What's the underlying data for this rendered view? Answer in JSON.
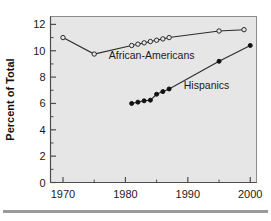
{
  "chart_data": {
    "type": "line",
    "title": "",
    "xlabel": "",
    "ylabel": "Percent of Total",
    "xlim": [
      1968,
      2001
    ],
    "ylim": [
      0,
      12.6
    ],
    "xticks": [
      1970,
      1980,
      1990,
      2000
    ],
    "xtick_labels": [
      "1970",
      "1980",
      "1990",
      "2000"
    ],
    "xminor_ticks": [
      1975,
      1985,
      1995
    ],
    "yticks": [
      0,
      2,
      4,
      6,
      8,
      10,
      12
    ],
    "ytick_labels": [
      "0",
      "2",
      "4",
      "6",
      "8",
      "10",
      "12"
    ],
    "yminor_ticks": [
      1,
      3,
      5,
      7,
      9,
      11
    ],
    "grid": false,
    "legend_position": "inline-annotations",
    "background": "#e6e6e6",
    "series": [
      {
        "name": "African-Americans",
        "marker": "open-circle",
        "color": "#2b2b2b",
        "x": [
          1970,
          1975,
          1981,
          1982,
          1983,
          1984,
          1985,
          1986,
          1987,
          1995,
          1999
        ],
        "values": [
          11.0,
          9.75,
          10.4,
          10.5,
          10.6,
          10.7,
          10.8,
          10.9,
          11.0,
          11.5,
          11.6
        ]
      },
      {
        "name": "Hispanics",
        "marker": "filled-circle",
        "color": "#111111",
        "x": [
          1981,
          1982,
          1983,
          1984,
          1985,
          1986,
          1987,
          1995,
          2000
        ],
        "values": [
          6.0,
          6.1,
          6.2,
          6.25,
          6.7,
          6.9,
          7.1,
          9.2,
          10.4
        ]
      }
    ],
    "annotations": [
      {
        "text": "African-Americans",
        "x": 1984.2,
        "y": 9.35
      },
      {
        "text": "Hispanics",
        "x": 1993.0,
        "y": 7.1
      }
    ]
  }
}
